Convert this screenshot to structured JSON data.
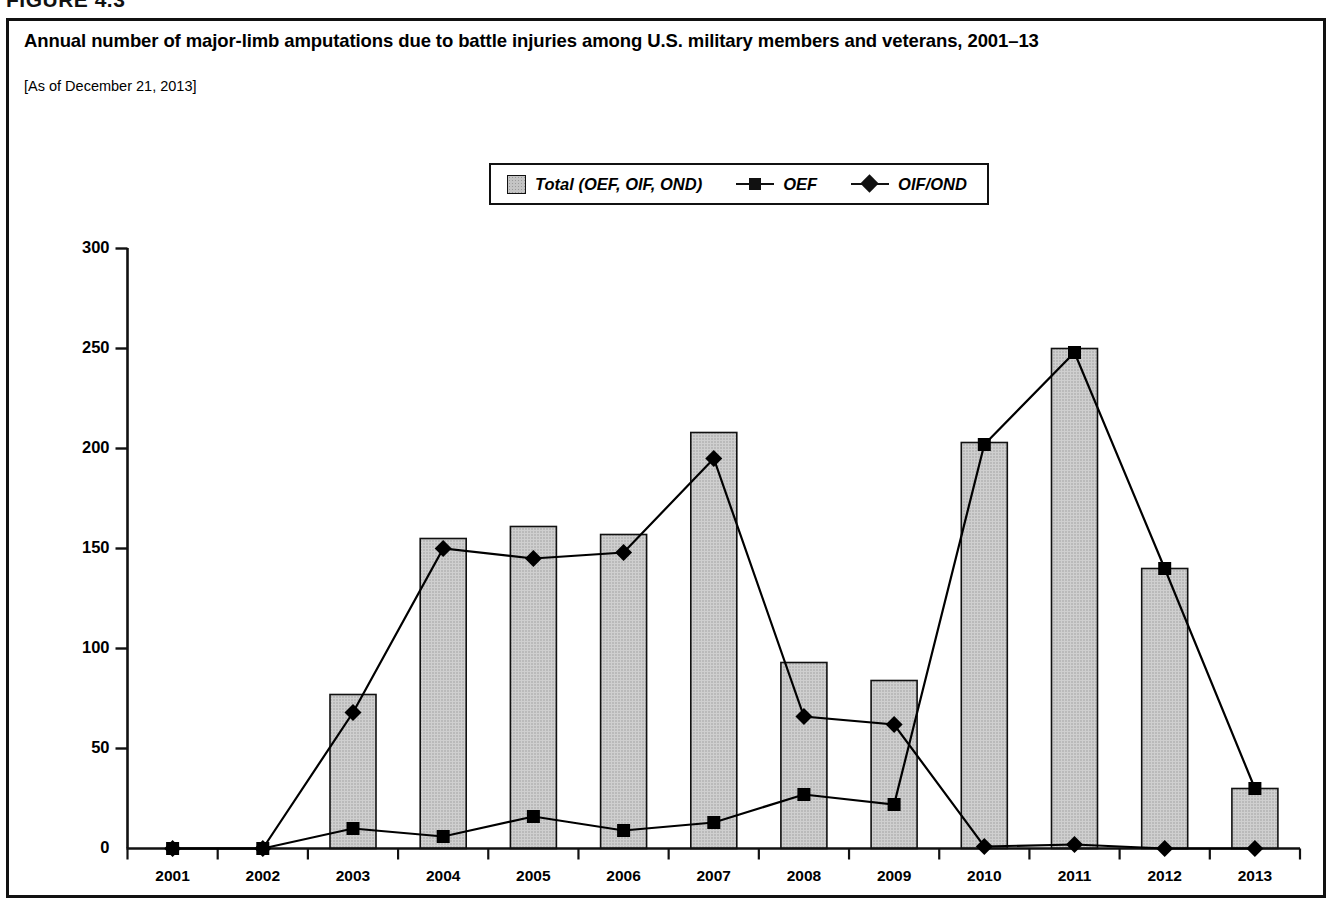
{
  "figure": {
    "label": "FIGURE 4.3"
  },
  "title": "Annual number of major-limb amputations due to battle injuries among U.S. military members and veterans, 2001–13",
  "subtitle": "[As of December 21, 2013]",
  "legend": {
    "items": [
      {
        "label": "Total (OEF, OIF, OND)",
        "marker": "bar-swatch"
      },
      {
        "label": "OEF",
        "marker": "square-marker"
      },
      {
        "label": "OIF/OND",
        "marker": "diamond-marker"
      }
    ]
  },
  "chart_data": {
    "type": "bar",
    "title": "Annual number of major-limb amputations due to battle injuries among U.S. military members and veterans, 2001–13",
    "subtitle": "[As of December 21, 2013]",
    "xlabel": "",
    "ylabel": "Battle injury, major limb amputation",
    "categories": [
      "2001",
      "2002",
      "2003",
      "2004",
      "2005",
      "2006",
      "2007",
      "2008",
      "2009",
      "2010",
      "2011",
      "2012",
      "2013"
    ],
    "ylim": [
      0,
      300
    ],
    "yticks": [
      0,
      50,
      100,
      150,
      200,
      250,
      300
    ],
    "grid": false,
    "legend_position": "top-center",
    "series": [
      {
        "name": "Total (OEF, OIF, OND)",
        "type": "bar",
        "color": "#c4c4c4",
        "values": [
          0,
          0,
          77,
          155,
          161,
          157,
          208,
          93,
          84,
          203,
          250,
          140,
          30
        ]
      },
      {
        "name": "OEF",
        "type": "line",
        "marker": "square",
        "color": "#000000",
        "values": [
          0,
          0,
          10,
          6,
          16,
          9,
          13,
          27,
          22,
          202,
          248,
          140,
          30
        ]
      },
      {
        "name": "OIF/OND",
        "type": "line",
        "marker": "diamond",
        "color": "#000000",
        "values": [
          0,
          0,
          68,
          150,
          145,
          148,
          195,
          66,
          62,
          1,
          2,
          0,
          0
        ]
      }
    ]
  },
  "colors": {
    "bar_fill": "#c4c4c4",
    "line": "#000000",
    "border": "#111111"
  }
}
